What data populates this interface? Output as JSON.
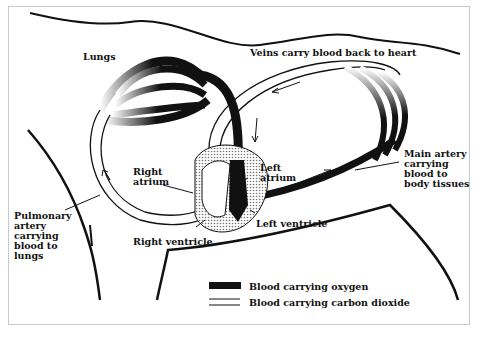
{
  "diagram": {
    "type": "circulatory-system",
    "labels": {
      "lungs": "Lungs",
      "veins": "Veins carry blood back to heart",
      "right_atrium": "Right\natrium",
      "left_atrium": "Left\natrium",
      "main_artery": "Main artery\ncarrying\nblood to\nbody tissues",
      "pulmonary_artery": "Pulmonary\nartery\ncarrying\nblood to\nlungs",
      "right_ventricle": "Right ventricle",
      "left_ventricle": "Left ventricle"
    },
    "legend": [
      {
        "label": "Blood carrying oxygen",
        "style": "thick-black"
      },
      {
        "label": "Blood carrying carbon dioxide",
        "style": "double-line"
      }
    ],
    "colors": {
      "ink": "#111111",
      "stipple": "#bdbdbd",
      "frame": "#c8c8c8"
    }
  }
}
